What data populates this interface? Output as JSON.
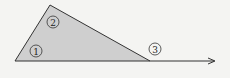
{
  "diagram": {
    "type": "triangle-with-exterior-ray",
    "colors": {
      "background": "#f4f4f2",
      "fill": "#cfcfcf",
      "stroke": "#333333"
    },
    "vertices": {
      "left": [
        15,
        61
      ],
      "apex": [
        50,
        5
      ],
      "right": [
        150,
        61
      ]
    },
    "ray_end": [
      216,
      61
    ],
    "angle_labels": [
      {
        "id": "1",
        "text": "1",
        "cx": 36,
        "cy": 51
      },
      {
        "id": "2",
        "text": "2",
        "cx": 53,
        "cy": 22
      },
      {
        "id": "3",
        "text": "3",
        "cx": 155,
        "cy": 49
      }
    ]
  }
}
